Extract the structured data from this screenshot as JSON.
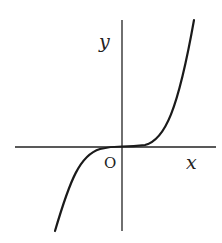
{
  "figure": {
    "type": "function-graph",
    "labels": {
      "y_axis": "y",
      "x_axis": "x",
      "origin": "O"
    },
    "colors": {
      "axis": "#222222",
      "curve": "#1a1a1a",
      "background": "#ffffff"
    },
    "axes": {
      "x_axis": {
        "x1": 15,
        "y1": 147,
        "x2": 216,
        "y2": 147
      },
      "y_axis": {
        "x1": 122,
        "y1": 20,
        "x2": 122,
        "y2": 231
      }
    },
    "curve": {
      "path": "M 55 231 C 70 180, 80 155, 100 149 C 110 146.5, 118 146.5, 122 146.5 C 126 146.5, 134 146.5, 145 145 C 165 140, 178 110, 194 20"
    }
  }
}
